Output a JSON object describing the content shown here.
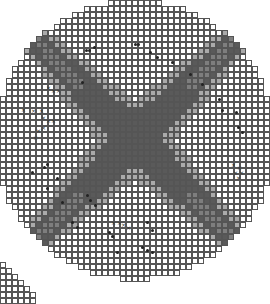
{
  "board": {
    "cell_size": 6,
    "center": [
      135,
      140
    ],
    "radius": 140,
    "colors": {
      "empty": "#ffffff",
      "dark": "#5a5a5a",
      "mid": "#7e7e7e",
      "light": "#aaaaaa",
      "grid": "#555555"
    },
    "dot_cells": [
      [
        84,
        48
      ],
      [
        87,
        48
      ],
      [
        92,
        45
      ],
      [
        133,
        42
      ],
      [
        136,
        42
      ],
      [
        148,
        50
      ],
      [
        155,
        55
      ],
      [
        170,
        60
      ],
      [
        188,
        72
      ],
      [
        200,
        82
      ],
      [
        217,
        97
      ],
      [
        220,
        108
      ],
      [
        234,
        110
      ],
      [
        236,
        125
      ],
      [
        240,
        130
      ],
      [
        80,
        80
      ],
      [
        55,
        176
      ],
      [
        45,
        162
      ],
      [
        42,
        165
      ],
      [
        30,
        170
      ],
      [
        45,
        186
      ],
      [
        60,
        200
      ],
      [
        85,
        193
      ],
      [
        88,
        198
      ],
      [
        93,
        203
      ],
      [
        107,
        230
      ],
      [
        110,
        234
      ],
      [
        70,
        220
      ],
      [
        75,
        225
      ],
      [
        115,
        250
      ],
      [
        145,
        220
      ],
      [
        150,
        228
      ],
      [
        140,
        245
      ],
      [
        145,
        248
      ],
      [
        150,
        250
      ]
    ],
    "x_cells": [
      [
        45,
        85
      ],
      [
        50,
        88
      ],
      [
        55,
        88
      ],
      [
        20,
        107
      ],
      [
        30,
        108
      ],
      [
        38,
        108
      ],
      [
        40,
        115
      ],
      [
        45,
        118
      ],
      [
        50,
        118
      ],
      [
        40,
        125
      ],
      [
        35,
        128
      ],
      [
        32,
        135
      ],
      [
        230,
        162
      ],
      [
        236,
        165
      ],
      [
        232,
        170
      ],
      [
        238,
        170
      ],
      [
        235,
        175
      ],
      [
        110,
        220
      ],
      [
        116,
        220
      ],
      [
        120,
        222
      ],
      [
        125,
        225
      ]
    ],
    "partial_grid": {
      "x0": 0,
      "y0": 262,
      "cols": 6,
      "rows": 7
    }
  }
}
